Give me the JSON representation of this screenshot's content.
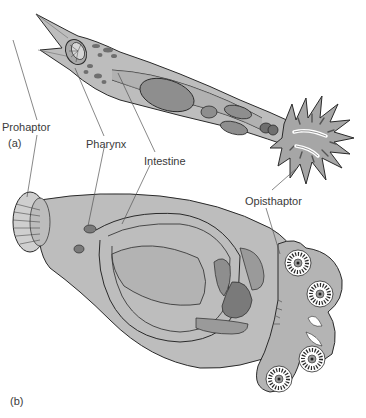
{
  "figure": {
    "panels": [
      {
        "id": "a",
        "label": "(a)"
      },
      {
        "id": "b",
        "label": "(b)"
      }
    ],
    "labels": {
      "prohaptor": "Prohaptor",
      "pharynx": "Pharynx",
      "intestine": "Intestine",
      "opisthaptor": "Opisthaptor"
    },
    "colors": {
      "body": "#bdbdbd",
      "body_light": "#cfcfcf",
      "organ": "#8e8e8e",
      "organ_dark": "#6f6f6f",
      "outline": "#2a2a2a",
      "text": "#3a3a3a",
      "leader": "#555555"
    }
  }
}
